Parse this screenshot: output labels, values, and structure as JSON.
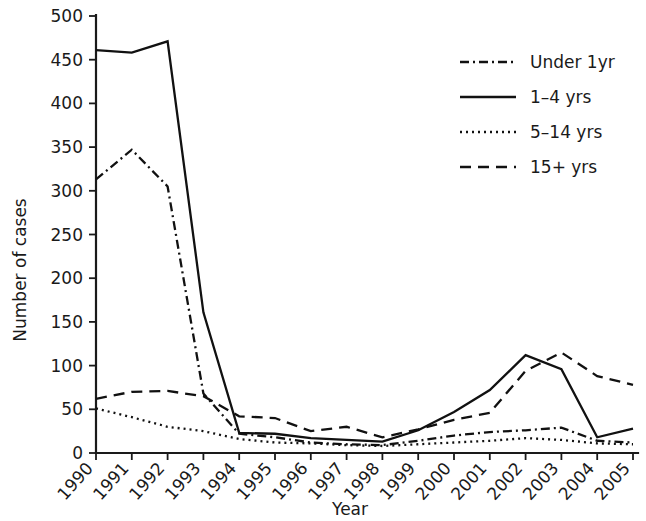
{
  "chart_data": {
    "type": "line",
    "title": "",
    "xlabel": "Year",
    "ylabel": "Number of cases",
    "x": [
      1990,
      1991,
      1992,
      1993,
      1994,
      1995,
      1996,
      1997,
      1998,
      1999,
      2000,
      2001,
      2002,
      2003,
      2004,
      2005
    ],
    "categories": [
      "1990",
      "1991",
      "1992",
      "1993",
      "1994",
      "1995",
      "1996",
      "1997",
      "1998",
      "1999",
      "2000",
      "2001",
      "2002",
      "2003",
      "2004",
      "2005"
    ],
    "xlim": [
      1990,
      2005
    ],
    "ylim": [
      0,
      500
    ],
    "yticks": [
      0,
      50,
      100,
      150,
      200,
      250,
      300,
      350,
      400,
      450,
      500
    ],
    "ytick_labels": [
      "0",
      "50",
      "100",
      "150",
      "200",
      "250",
      "300",
      "350",
      "400",
      "450",
      "500"
    ],
    "grid": false,
    "legend_position": "top-right",
    "series": [
      {
        "name": "Under 1yr",
        "style": "dashdot",
        "dasharray": "9,4,2,4",
        "values": [
          313,
          347,
          305,
          68,
          22,
          18,
          12,
          10,
          9,
          14,
          20,
          24,
          26,
          29,
          14,
          12
        ]
      },
      {
        "name": "1–4 yrs",
        "style": "solid",
        "dasharray": "",
        "values": [
          461,
          458,
          471,
          161,
          23,
          22,
          17,
          15,
          13,
          26,
          47,
          72,
          112,
          96,
          18,
          28
        ]
      },
      {
        "name": "5–14 yrs",
        "style": "dotted",
        "dasharray": "2,4",
        "values": [
          51,
          41,
          30,
          25,
          16,
          12,
          11,
          9,
          8,
          10,
          12,
          14,
          17,
          15,
          11,
          10
        ]
      },
      {
        "name": "15+ yrs",
        "style": "dashed",
        "dasharray": "11,7",
        "values": [
          62,
          70,
          71,
          65,
          42,
          40,
          25,
          30,
          18,
          27,
          38,
          46,
          94,
          115,
          88,
          78
        ]
      }
    ]
  },
  "axes": {
    "y_title": "Number of cases",
    "x_title": "Year"
  },
  "legend": {
    "entries": [
      {
        "label": "Under 1yr"
      },
      {
        "label": "1–4 yrs"
      },
      {
        "label": "5–14 yrs"
      },
      {
        "label": "15+ yrs"
      }
    ]
  },
  "colors": {
    "ink": "#111111",
    "background": "#ffffff"
  }
}
